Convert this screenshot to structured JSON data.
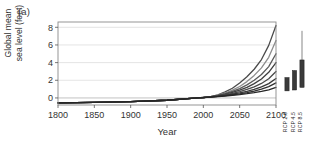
{
  "figure": {
    "panel_label": "(a)",
    "background": "#ffffff"
  },
  "axes": {
    "xlabel": "Year",
    "ylabel": "Global mean\nsea level (feet)",
    "ylabel_line1": "Global mean",
    "ylabel_line2": "sea level (feet)",
    "xticks": [
      "1800",
      "1850",
      "1900",
      "1950",
      "2000",
      "2050",
      "2100"
    ],
    "yticks": [
      "0",
      "2",
      "4",
      "6",
      "8"
    ],
    "frame_color": "#8a8a8a",
    "grid_color": "#d8d8d8"
  },
  "scenarios": {
    "labels": [
      "RCP 2.6",
      "RCP 4.5",
      "RCP 8.5"
    ],
    "label_0": "RCP 2.6",
    "label_1": "RCP 4.5",
    "label_2": "RCP 8.5"
  },
  "chart_data": {
    "type": "line",
    "title": "",
    "xlabel": "Year",
    "ylabel": "Global mean sea level (feet)",
    "xlim": [
      1800,
      2100
    ],
    "ylim": [
      -0.8,
      8.6
    ],
    "xticks": [
      1800,
      1850,
      1900,
      1950,
      2000,
      2050,
      2100
    ],
    "yticks": [
      0,
      2,
      4,
      6,
      8
    ],
    "grid": "horizontal",
    "legend": "none",
    "x": [
      1800,
      1850,
      1900,
      1950,
      1992,
      2000,
      2010,
      2020,
      2030,
      2040,
      2050,
      2060,
      2070,
      2080,
      2090,
      2100
    ],
    "series": [
      {
        "name": "Extreme",
        "color": "#4a4a4a",
        "values": [
          -0.55,
          -0.5,
          -0.42,
          -0.26,
          0.0,
          0.05,
          0.16,
          0.35,
          0.68,
          1.1,
          1.7,
          2.4,
          3.25,
          4.35,
          5.95,
          8.2
        ]
      },
      {
        "name": "High",
        "color": "#8c8c8c",
        "values": [
          -0.55,
          -0.5,
          -0.42,
          -0.26,
          0.0,
          0.05,
          0.15,
          0.31,
          0.56,
          0.88,
          1.3,
          1.85,
          2.55,
          3.4,
          4.6,
          6.5
        ]
      },
      {
        "name": "Intermediate-High",
        "color": "#5a5a5a",
        "values": [
          -0.55,
          -0.5,
          -0.42,
          -0.26,
          0.0,
          0.05,
          0.14,
          0.28,
          0.48,
          0.74,
          1.06,
          1.48,
          2.0,
          2.65,
          3.55,
          5.0
        ]
      },
      {
        "name": "Intermediate",
        "color": "#3f3f3f",
        "values": [
          -0.55,
          -0.5,
          -0.42,
          -0.26,
          0.0,
          0.05,
          0.13,
          0.25,
          0.42,
          0.63,
          0.88,
          1.2,
          1.62,
          2.14,
          2.9,
          4.0
        ]
      },
      {
        "name": "Intermediate-Low",
        "color": "#4a4a4a",
        "values": [
          -0.55,
          -0.5,
          -0.42,
          -0.26,
          0.0,
          0.05,
          0.12,
          0.22,
          0.36,
          0.52,
          0.72,
          0.96,
          1.26,
          1.64,
          2.18,
          3.0
        ]
      },
      {
        "name": "Low",
        "color": "#383838",
        "values": [
          -0.55,
          -0.5,
          -0.42,
          -0.26,
          0.0,
          0.04,
          0.11,
          0.19,
          0.3,
          0.42,
          0.57,
          0.75,
          0.98,
          1.25,
          1.62,
          2.2
        ]
      },
      {
        "name": "Lowest",
        "color": "#2f2f2f",
        "values": [
          -0.55,
          -0.5,
          -0.42,
          -0.26,
          0.0,
          0.04,
          0.1,
          0.17,
          0.26,
          0.36,
          0.47,
          0.61,
          0.78,
          0.99,
          1.28,
          1.7
        ]
      },
      {
        "name": "Observed/Min",
        "color": "#262626",
        "values": [
          -0.55,
          -0.5,
          -0.42,
          -0.26,
          0.0,
          0.04,
          0.09,
          0.15,
          0.22,
          0.3,
          0.38,
          0.48,
          0.6,
          0.74,
          0.92,
          1.2
        ]
      }
    ],
    "ranges": {
      "type": "box",
      "labels": [
        "RCP 2.6",
        "RCP 4.5",
        "RCP 8.5"
      ],
      "boxes": [
        {
          "label": "RCP 2.6",
          "low": 0.8,
          "high": 2.3,
          "whisker_low": 0.8,
          "whisker_high": 2.3
        },
        {
          "label": "RCP 4.5",
          "low": 0.9,
          "high": 3.1,
          "whisker_low": 0.9,
          "whisker_high": 3.1
        },
        {
          "label": "RCP 8.5",
          "low": 1.2,
          "high": 4.3,
          "whisker_low": 1.2,
          "whisker_high": 7.6
        }
      ]
    }
  }
}
